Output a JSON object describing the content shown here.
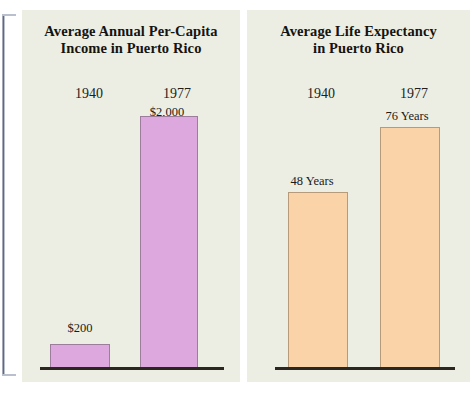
{
  "figure": {
    "background_color": "#ffffff",
    "panel_background_color": "#eceee4"
  },
  "panels": [
    {
      "name": "income",
      "title_line_1": "Average Annual Per-Capita",
      "title_line_2": "Income in Puerto Rico",
      "bar_color": "#dda8dd",
      "year_1940": "1940",
      "year_1977": "1977",
      "value_1940": "$200",
      "value_1977": "$2,000"
    },
    {
      "name": "life-expectancy",
      "title_line_1": "Average Life Expectancy",
      "title_line_2": "in Puerto Rico",
      "bar_color": "#fad4a8",
      "year_1940": "1940",
      "year_1977": "1977",
      "value_1940": "48 Years",
      "value_1977": "76 Years"
    }
  ],
  "chart_data": [
    {
      "type": "bar",
      "title": "Average Annual Per-Capita Income in Puerto Rico",
      "xlabel": "",
      "ylabel": "",
      "categories": [
        "1940",
        "1977"
      ],
      "values": [
        200,
        2000
      ],
      "data_labels": [
        "$200",
        "$2,000"
      ],
      "units": "US dollars per capita",
      "ylim": [
        0,
        2000
      ],
      "grid": false,
      "legend": false,
      "series_color": "#dda8dd"
    },
    {
      "type": "bar",
      "title": "Average Life Expectancy in Puerto Rico",
      "xlabel": "",
      "ylabel": "",
      "categories": [
        "1940",
        "1977"
      ],
      "values": [
        48,
        76
      ],
      "data_labels": [
        "48 Years",
        "76 Years"
      ],
      "units": "years",
      "ylim": [
        0,
        76
      ],
      "grid": false,
      "legend": false,
      "series_color": "#fad4a8"
    }
  ]
}
